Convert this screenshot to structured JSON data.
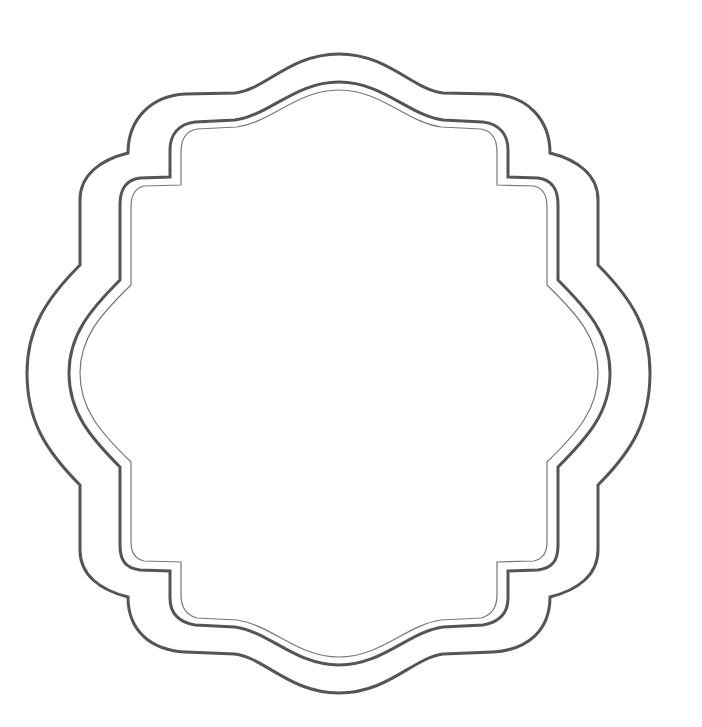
{
  "figure": {
    "colors": {
      "background": "#ffffff",
      "outer_stroke": "#555555",
      "middle_stroke": "#555555",
      "inner_stroke": "#777777"
    },
    "borders": [
      {
        "name": "outer",
        "stroke_width": 3
      },
      {
        "name": "middle",
        "stroke_width": 3
      },
      {
        "name": "inner",
        "stroke_width": 1.2
      }
    ]
  }
}
